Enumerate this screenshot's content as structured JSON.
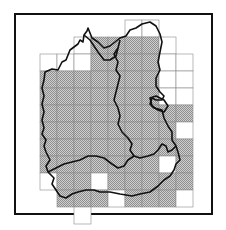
{
  "map": {
    "description": "Gridded regional map with hatched (surveyed) squares and district boundaries",
    "grid": {
      "origin_x": 40,
      "origin_y": 20,
      "cell": 17,
      "cells": [
        {
          "c": 5,
          "r": 0,
          "fill": false
        },
        {
          "c": 6,
          "r": 0,
          "fill": false
        },
        {
          "c": 2,
          "r": 1,
          "fill": false
        },
        {
          "c": 3,
          "r": 1,
          "fill": true
        },
        {
          "c": 4,
          "r": 1,
          "fill": true
        },
        {
          "c": 5,
          "r": 1,
          "fill": true
        },
        {
          "c": 6,
          "r": 1,
          "fill": true
        },
        {
          "c": 7,
          "r": 1,
          "fill": false
        },
        {
          "c": 0,
          "r": 2,
          "fill": false
        },
        {
          "c": 1,
          "r": 2,
          "fill": false
        },
        {
          "c": 2,
          "r": 2,
          "fill": false
        },
        {
          "c": 3,
          "r": 2,
          "fill": true
        },
        {
          "c": 4,
          "r": 2,
          "fill": true
        },
        {
          "c": 5,
          "r": 2,
          "fill": true
        },
        {
          "c": 6,
          "r": 2,
          "fill": true
        },
        {
          "c": 7,
          "r": 2,
          "fill": false
        },
        {
          "c": 8,
          "r": 2,
          "fill": false
        },
        {
          "c": 0,
          "r": 3,
          "fill": true
        },
        {
          "c": 1,
          "r": 3,
          "fill": true
        },
        {
          "c": 2,
          "r": 3,
          "fill": true
        },
        {
          "c": 3,
          "r": 3,
          "fill": true
        },
        {
          "c": 4,
          "r": 3,
          "fill": true
        },
        {
          "c": 5,
          "r": 3,
          "fill": true
        },
        {
          "c": 6,
          "r": 3,
          "fill": true
        },
        {
          "c": 7,
          "r": 3,
          "fill": false
        },
        {
          "c": 8,
          "r": 3,
          "fill": false
        },
        {
          "c": 0,
          "r": 4,
          "fill": true
        },
        {
          "c": 1,
          "r": 4,
          "fill": true
        },
        {
          "c": 2,
          "r": 4,
          "fill": true
        },
        {
          "c": 3,
          "r": 4,
          "fill": true
        },
        {
          "c": 4,
          "r": 4,
          "fill": true
        },
        {
          "c": 5,
          "r": 4,
          "fill": true
        },
        {
          "c": 6,
          "r": 4,
          "fill": true
        },
        {
          "c": 7,
          "r": 4,
          "fill": false
        },
        {
          "c": 8,
          "r": 4,
          "fill": false
        },
        {
          "c": 0,
          "r": 5,
          "fill": true
        },
        {
          "c": 1,
          "r": 5,
          "fill": true
        },
        {
          "c": 2,
          "r": 5,
          "fill": true
        },
        {
          "c": 3,
          "r": 5,
          "fill": true
        },
        {
          "c": 4,
          "r": 5,
          "fill": true
        },
        {
          "c": 5,
          "r": 5,
          "fill": true
        },
        {
          "c": 6,
          "r": 5,
          "fill": true
        },
        {
          "c": 7,
          "r": 5,
          "fill": true
        },
        {
          "c": 8,
          "r": 5,
          "fill": true
        },
        {
          "c": 0,
          "r": 6,
          "fill": true
        },
        {
          "c": 1,
          "r": 6,
          "fill": true
        },
        {
          "c": 2,
          "r": 6,
          "fill": true
        },
        {
          "c": 3,
          "r": 6,
          "fill": true
        },
        {
          "c": 4,
          "r": 6,
          "fill": true
        },
        {
          "c": 5,
          "r": 6,
          "fill": true
        },
        {
          "c": 6,
          "r": 6,
          "fill": true
        },
        {
          "c": 7,
          "r": 6,
          "fill": true
        },
        {
          "c": 8,
          "r": 6,
          "fill": false
        },
        {
          "c": 0,
          "r": 7,
          "fill": true
        },
        {
          "c": 1,
          "r": 7,
          "fill": true
        },
        {
          "c": 2,
          "r": 7,
          "fill": true
        },
        {
          "c": 3,
          "r": 7,
          "fill": true
        },
        {
          "c": 4,
          "r": 7,
          "fill": true
        },
        {
          "c": 5,
          "r": 7,
          "fill": true
        },
        {
          "c": 6,
          "r": 7,
          "fill": true
        },
        {
          "c": 7,
          "r": 7,
          "fill": true
        },
        {
          "c": 8,
          "r": 7,
          "fill": true
        },
        {
          "c": 0,
          "r": 8,
          "fill": true
        },
        {
          "c": 1,
          "r": 8,
          "fill": true
        },
        {
          "c": 2,
          "r": 8,
          "fill": true
        },
        {
          "c": 3,
          "r": 8,
          "fill": true
        },
        {
          "c": 4,
          "r": 8,
          "fill": true
        },
        {
          "c": 5,
          "r": 8,
          "fill": true
        },
        {
          "c": 6,
          "r": 8,
          "fill": true
        },
        {
          "c": 7,
          "r": 8,
          "fill": false
        },
        {
          "c": 8,
          "r": 8,
          "fill": true
        },
        {
          "c": 0,
          "r": 9,
          "fill": false
        },
        {
          "c": 1,
          "r": 9,
          "fill": true
        },
        {
          "c": 2,
          "r": 9,
          "fill": true
        },
        {
          "c": 3,
          "r": 9,
          "fill": false
        },
        {
          "c": 4,
          "r": 9,
          "fill": true
        },
        {
          "c": 5,
          "r": 9,
          "fill": true
        },
        {
          "c": 6,
          "r": 9,
          "fill": true
        },
        {
          "c": 7,
          "r": 9,
          "fill": true
        },
        {
          "c": 8,
          "r": 9,
          "fill": true
        },
        {
          "c": 1,
          "r": 10,
          "fill": true
        },
        {
          "c": 2,
          "r": 10,
          "fill": true
        },
        {
          "c": 3,
          "r": 10,
          "fill": true
        },
        {
          "c": 4,
          "r": 10,
          "fill": false
        },
        {
          "c": 5,
          "r": 10,
          "fill": true
        },
        {
          "c": 6,
          "r": 10,
          "fill": true
        },
        {
          "c": 7,
          "r": 10,
          "fill": true
        },
        {
          "c": 8,
          "r": 10,
          "fill": false
        },
        {
          "c": 2,
          "r": 11,
          "fill": false
        }
      ]
    },
    "colors": {
      "hatch": "#9a9a9a",
      "hatch_bg": "#d0d0d0",
      "grid": "#8a8a8a",
      "border": "#111111",
      "boundary": "#111111"
    }
  }
}
